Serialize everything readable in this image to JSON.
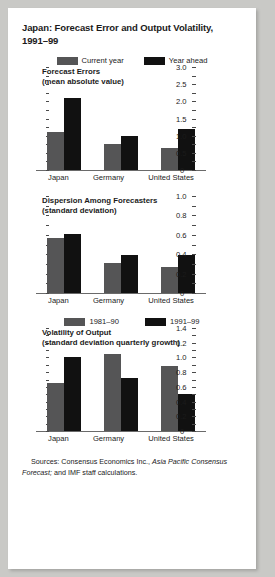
{
  "figure": {
    "title": "Japan: Forecast Error and Output Volatility, 1991–99",
    "source_prefix": "Sources: Consensus Economics Inc., ",
    "source_italic": "Asia Pacific Consensus Forecast;",
    "source_suffix": " and IMF staff calculations."
  },
  "legend_main": {
    "items": [
      {
        "label": "Current year",
        "color": "#555556",
        "swatch": "grey-swatch"
      },
      {
        "label": "Year ahead",
        "color": "#111111",
        "swatch": "black-swatch"
      }
    ]
  },
  "legend_third": {
    "items": [
      {
        "label": "1981–90",
        "color": "#555556",
        "swatch": "grey-swatch"
      },
      {
        "label": "1991–99",
        "color": "#111111",
        "swatch": "black-swatch"
      }
    ]
  },
  "chart_data": [
    {
      "type": "bar",
      "title": "Forecast Errors",
      "subtitle": "(mean absolute value)",
      "categories": [
        "Japan",
        "Germany",
        "United States"
      ],
      "series": [
        {
          "name": "Current year",
          "color": "#555556",
          "values": [
            1.1,
            0.75,
            0.65
          ]
        },
        {
          "name": "Year ahead",
          "color": "#111111",
          "values": [
            2.1,
            1.0,
            1.2
          ]
        }
      ],
      "ylim": [
        0,
        3.0
      ],
      "yticks": [
        0,
        0.5,
        1.0,
        1.5,
        2.0,
        2.5,
        3.0
      ],
      "ytick_labels": [
        "0",
        "0.5",
        "1.0",
        "1.5",
        "2.0",
        "2.5",
        "3.0"
      ],
      "minor_tick_step": 0.25,
      "xlabel": "",
      "ylabel": "",
      "grid": false,
      "legend_position": "top-center"
    },
    {
      "type": "bar",
      "title": "Dispersion Among Forecasters",
      "subtitle": "(standard deviation)",
      "categories": [
        "Japan",
        "Germany",
        "United States"
      ],
      "series": [
        {
          "name": "Current year",
          "color": "#555556",
          "values": [
            0.57,
            0.31,
            0.27
          ]
        },
        {
          "name": "Year ahead",
          "color": "#111111",
          "values": [
            0.61,
            0.39,
            0.39
          ]
        }
      ],
      "ylim": [
        0,
        1.0
      ],
      "yticks": [
        0,
        0.2,
        0.4,
        0.6,
        0.8,
        1.0
      ],
      "ytick_labels": [
        "0",
        "0.2",
        "0.4",
        "0.6",
        "0.8",
        "1.0"
      ],
      "minor_tick_step": 0.1,
      "xlabel": "",
      "ylabel": "",
      "grid": false,
      "legend_position": "shared-top"
    },
    {
      "type": "bar",
      "title": "Volatility of Output",
      "subtitle": "(standard deviation quarterly growth)",
      "categories": [
        "Japan",
        "Germany",
        "United States"
      ],
      "series": [
        {
          "name": "1981–90",
          "color": "#555556",
          "values": [
            0.65,
            1.05,
            0.88
          ]
        },
        {
          "name": "1991–99",
          "color": "#111111",
          "values": [
            1.0,
            0.72,
            0.5
          ]
        }
      ],
      "ylim": [
        0,
        1.4
      ],
      "yticks": [
        0,
        0.2,
        0.4,
        0.6,
        0.8,
        1.0,
        1.2,
        1.4
      ],
      "ytick_labels": [
        "0",
        "0.2",
        "0.4",
        "0.6",
        "0.8",
        "1.0",
        "1.2",
        "1.4"
      ],
      "minor_tick_step": 0.1,
      "xlabel": "",
      "ylabel": "",
      "grid": false,
      "legend_position": "top-center"
    }
  ]
}
